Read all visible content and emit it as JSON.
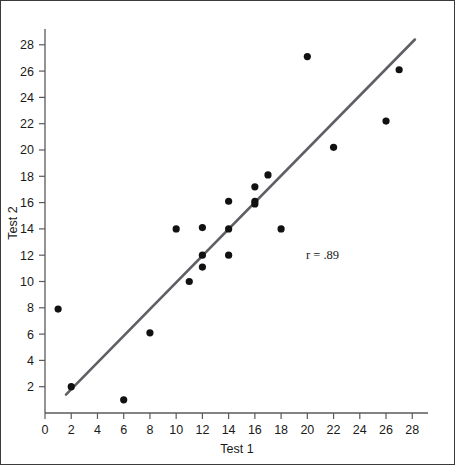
{
  "figure": {
    "background_color": "#ffffff",
    "border_color": "#3a3a3a",
    "point_color": "#111111",
    "line_color": "#5f5f66",
    "axis_color": "#5a5a5a"
  },
  "annotation": {
    "correlation_label": "r = .89"
  },
  "chart_data": {
    "type": "scatter",
    "title": "",
    "xlabel": "Test 1",
    "ylabel": "Test 2",
    "xlim": [
      0,
      29.2
    ],
    "ylim": [
      0,
      29.2
    ],
    "xticks": [
      0,
      2,
      4,
      6,
      8,
      10,
      12,
      14,
      16,
      18,
      20,
      22,
      24,
      26,
      28
    ],
    "yticks": [
      2,
      4,
      6,
      8,
      10,
      12,
      14,
      16,
      18,
      20,
      22,
      24,
      26,
      28
    ],
    "xticklabels": [
      "0",
      "2",
      "4",
      "6",
      "8",
      "10",
      "12",
      "14",
      "16",
      "18",
      "20",
      "22",
      "24",
      "26",
      "28"
    ],
    "yticklabels": [
      "2",
      "4",
      "6",
      "8",
      "10",
      "12",
      "14",
      "16",
      "18",
      "20",
      "22",
      "24",
      "26",
      "28"
    ],
    "grid": false,
    "legend": false,
    "annotations": [
      {
        "text": "r = .89",
        "x": 21.0,
        "y": 12.3
      }
    ],
    "series": [
      {
        "name": "Students",
        "marker": "circle",
        "color": "#111111",
        "points": [
          {
            "x": 1,
            "y": 7.9
          },
          {
            "x": 2,
            "y": 2.0
          },
          {
            "x": 6,
            "y": 1.0
          },
          {
            "x": 8,
            "y": 6.1
          },
          {
            "x": 10,
            "y": 14.0
          },
          {
            "x": 11,
            "y": 10.0
          },
          {
            "x": 12,
            "y": 11.1
          },
          {
            "x": 12,
            "y": 12.0
          },
          {
            "x": 12,
            "y": 14.1
          },
          {
            "x": 14,
            "y": 12.0
          },
          {
            "x": 14,
            "y": 14.0
          },
          {
            "x": 14,
            "y": 16.1
          },
          {
            "x": 16,
            "y": 15.9
          },
          {
            "x": 16,
            "y": 16.1
          },
          {
            "x": 16,
            "y": 17.2
          },
          {
            "x": 17,
            "y": 18.1
          },
          {
            "x": 18,
            "y": 14.0
          },
          {
            "x": 20,
            "y": 27.1
          },
          {
            "x": 22,
            "y": 20.2
          },
          {
            "x": 26,
            "y": 22.2
          },
          {
            "x": 27,
            "y": 26.1
          }
        ]
      }
    ],
    "fit_line": {
      "name": "regression-line",
      "color": "#5f5f66",
      "x_start": 1.6,
      "y_start": 1.4,
      "x_end": 28.2,
      "y_end": 28.4
    }
  }
}
